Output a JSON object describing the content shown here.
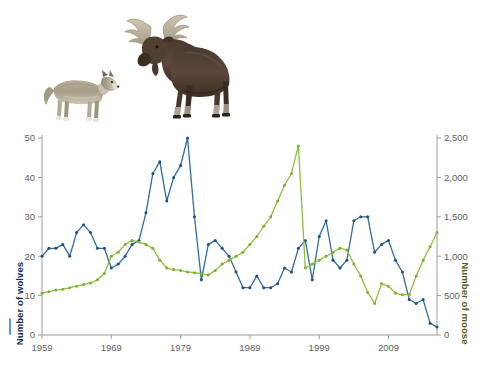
{
  "figure": {
    "illustrations": [
      {
        "name": "wolf-image",
        "alt": "Gray wolf standing, side view facing right"
      },
      {
        "name": "moose-image",
        "alt": "Bull moose with antlers standing, side view facing left"
      }
    ]
  },
  "axes": {
    "left_title": "Number of wolves",
    "right_title": "Number of moose",
    "left_color": "#0e2d5c",
    "right_color": "#5a5a20",
    "left_ticks": [
      "0",
      "10",
      "20",
      "30",
      "40",
      "50"
    ],
    "right_ticks": [
      "0",
      "500",
      "1,000",
      "1,500",
      "2,000",
      "2,500"
    ],
    "x_ticks": [
      "1959",
      "1969",
      "1979",
      "1989",
      "1999",
      "2009"
    ]
  },
  "chart_data": {
    "type": "line",
    "title": "",
    "subtitle": "",
    "xlabel": "",
    "ylabel": "Number of wolves",
    "y2label": "Number of moose",
    "xlim": [
      1959,
      2016
    ],
    "ylim": [
      0,
      50
    ],
    "y2lim": [
      0,
      2500
    ],
    "grid": false,
    "legend": "axis-titles-with-color-dashes",
    "x": [
      1959,
      1960,
      1961,
      1962,
      1963,
      1964,
      1965,
      1966,
      1967,
      1968,
      1969,
      1970,
      1971,
      1972,
      1973,
      1974,
      1975,
      1976,
      1977,
      1978,
      1979,
      1980,
      1981,
      1982,
      1983,
      1984,
      1985,
      1986,
      1987,
      1988,
      1989,
      1990,
      1991,
      1992,
      1993,
      1994,
      1995,
      1996,
      1997,
      1998,
      1999,
      2000,
      2001,
      2002,
      2003,
      2004,
      2005,
      2006,
      2007,
      2008,
      2009,
      2010,
      2011,
      2012,
      2013,
      2014,
      2015,
      2016
    ],
    "series": [
      {
        "name": "Number of wolves",
        "axis": "left",
        "color": "#2e6ca4",
        "marker_color": "#1f4f7a",
        "values": [
          20,
          22,
          22,
          23,
          20,
          26,
          28,
          26,
          22,
          22,
          17,
          18,
          20,
          23,
          24,
          31,
          41,
          44,
          34,
          40,
          43,
          50,
          30,
          14,
          23,
          24,
          22,
          20,
          16,
          12,
          12,
          15,
          12,
          12,
          13,
          17,
          16,
          22,
          24,
          14,
          25,
          29,
          19,
          17,
          19,
          29,
          30,
          30,
          21,
          23,
          24,
          19,
          16,
          9,
          8,
          9,
          3,
          2
        ]
      },
      {
        "name": "Number of moose",
        "axis": "right",
        "color": "#8cbf3f",
        "marker_color": "#7fae36",
        "values": [
          530,
          550,
          570,
          580,
          600,
          620,
          640,
          660,
          700,
          780,
          1000,
          1050,
          1150,
          1200,
          1180,
          1150,
          1100,
          950,
          850,
          830,
          820,
          800,
          790,
          780,
          760,
          820,
          900,
          950,
          1000,
          1050,
          1150,
          1250,
          1380,
          1500,
          1700,
          1900,
          2050,
          2400,
          850,
          900,
          950,
          1000,
          1050,
          1100,
          1080,
          900,
          750,
          540,
          400,
          650,
          620,
          530,
          510,
          515,
          750,
          950,
          1120,
          1300
        ]
      }
    ]
  }
}
